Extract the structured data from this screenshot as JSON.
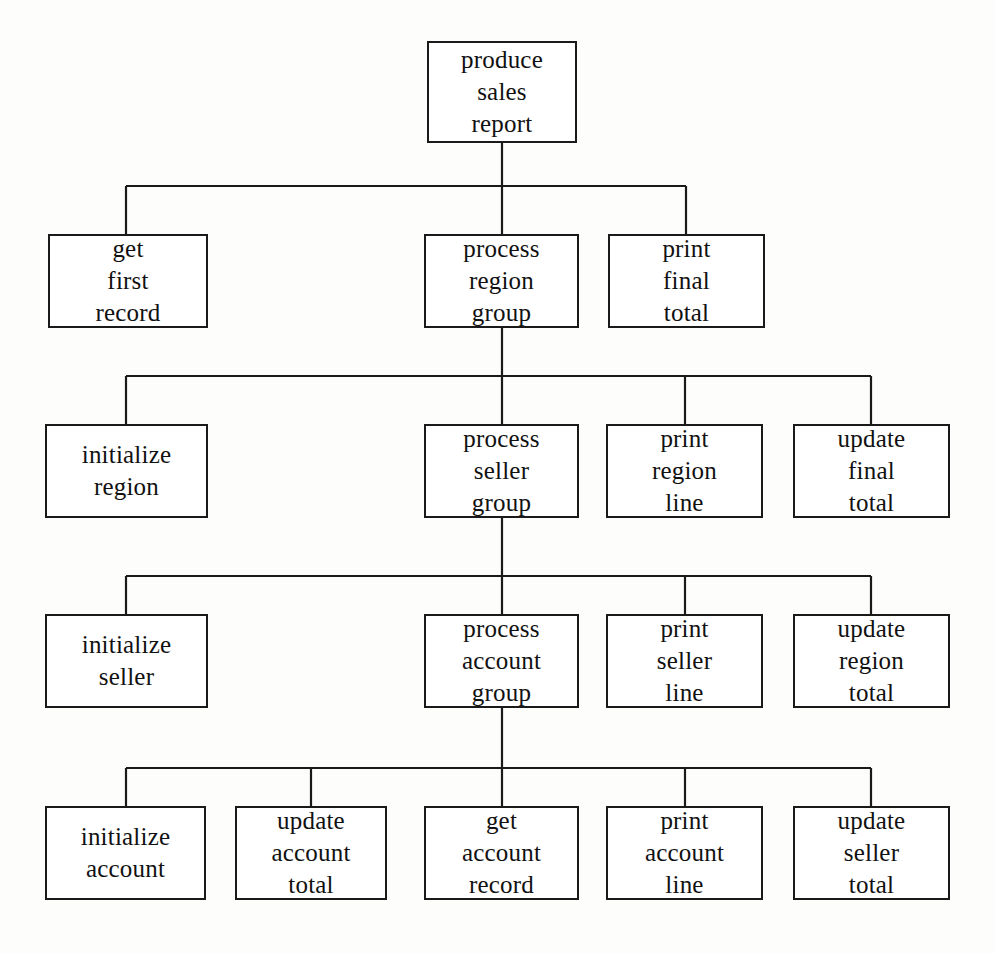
{
  "diagram": {
    "type": "structure-chart",
    "box_border_color": "#1a1a1a",
    "box_fill_color": "#ffffff",
    "line_color": "#1a1a1a",
    "background_color": "#fdfdfc",
    "levels": 5
  },
  "nodes": [
    {
      "id": "produce-sales-report",
      "lines": [
        "produce",
        "sales",
        "report"
      ],
      "level": 1,
      "x": 427,
      "y": 41,
      "w": 150,
      "h": 102
    },
    {
      "id": "get-first-record",
      "lines": [
        "get",
        "first",
        "record"
      ],
      "level": 2,
      "x": 48,
      "y": 234,
      "w": 160,
      "h": 94
    },
    {
      "id": "process-region-group",
      "lines": [
        "process",
        "region",
        "group"
      ],
      "level": 2,
      "x": 424,
      "y": 234,
      "w": 155,
      "h": 94
    },
    {
      "id": "print-final-total",
      "lines": [
        "print",
        "final",
        "total"
      ],
      "level": 2,
      "x": 608,
      "y": 234,
      "w": 157,
      "h": 94
    },
    {
      "id": "initialize-region",
      "lines": [
        "initialize",
        "region"
      ],
      "level": 3,
      "x": 45,
      "y": 424,
      "w": 163,
      "h": 94
    },
    {
      "id": "process-seller-group",
      "lines": [
        "process",
        "seller",
        "group"
      ],
      "level": 3,
      "x": 424,
      "y": 424,
      "w": 155,
      "h": 94
    },
    {
      "id": "print-region-line",
      "lines": [
        "print",
        "region",
        "line"
      ],
      "level": 3,
      "x": 606,
      "y": 424,
      "w": 157,
      "h": 94
    },
    {
      "id": "update-final-total",
      "lines": [
        "update",
        "final",
        "total"
      ],
      "level": 3,
      "x": 793,
      "y": 424,
      "w": 157,
      "h": 94
    },
    {
      "id": "initialize-seller",
      "lines": [
        "initialize",
        "seller"
      ],
      "level": 4,
      "x": 45,
      "y": 614,
      "w": 163,
      "h": 94
    },
    {
      "id": "process-account-group",
      "lines": [
        "process",
        "account",
        "group"
      ],
      "level": 4,
      "x": 424,
      "y": 614,
      "w": 155,
      "h": 94
    },
    {
      "id": "print-seller-line",
      "lines": [
        "print",
        "seller",
        "line"
      ],
      "level": 4,
      "x": 606,
      "y": 614,
      "w": 157,
      "h": 94
    },
    {
      "id": "update-region-total",
      "lines": [
        "update",
        "region",
        "total"
      ],
      "level": 4,
      "x": 793,
      "y": 614,
      "w": 157,
      "h": 94
    },
    {
      "id": "initialize-account",
      "lines": [
        "initialize",
        "account"
      ],
      "level": 5,
      "x": 45,
      "y": 806,
      "w": 161,
      "h": 94
    },
    {
      "id": "update-account-total",
      "lines": [
        "update",
        "account",
        "total"
      ],
      "level": 5,
      "x": 235,
      "y": 806,
      "w": 152,
      "h": 94
    },
    {
      "id": "get-account-record",
      "lines": [
        "get",
        "account",
        "record"
      ],
      "level": 5,
      "x": 424,
      "y": 806,
      "w": 155,
      "h": 94
    },
    {
      "id": "print-account-line",
      "lines": [
        "print",
        "account",
        "line"
      ],
      "level": 5,
      "x": 606,
      "y": 806,
      "w": 157,
      "h": 94
    },
    {
      "id": "update-seller-total",
      "lines": [
        "update",
        "seller",
        "total"
      ],
      "level": 5,
      "x": 793,
      "y": 806,
      "w": 157,
      "h": 94
    }
  ],
  "connectors": [
    {
      "id": "trunk-level1",
      "type": "vertical",
      "x": 502,
      "y1": 143,
      "y2": 186
    },
    {
      "id": "rail-level2",
      "type": "horizontal",
      "y": 186,
      "x1": 126,
      "x2": 686
    },
    {
      "id": "drop-get-first-record",
      "type": "vertical",
      "x": 126,
      "y1": 186,
      "y2": 234
    },
    {
      "id": "drop-process-region-group",
      "type": "vertical",
      "x": 502,
      "y1": 186,
      "y2": 234
    },
    {
      "id": "drop-print-final-total",
      "type": "vertical",
      "x": 686,
      "y1": 186,
      "y2": 234
    },
    {
      "id": "trunk-level2",
      "type": "vertical",
      "x": 502,
      "y1": 328,
      "y2": 376
    },
    {
      "id": "rail-level3",
      "type": "horizontal",
      "y": 376,
      "x1": 126,
      "x2": 871
    },
    {
      "id": "drop-initialize-region",
      "type": "vertical",
      "x": 126,
      "y1": 376,
      "y2": 424
    },
    {
      "id": "drop-process-seller-group",
      "type": "vertical",
      "x": 502,
      "y1": 376,
      "y2": 424
    },
    {
      "id": "drop-print-region-line",
      "type": "vertical",
      "x": 685,
      "y1": 376,
      "y2": 424
    },
    {
      "id": "drop-update-final-total",
      "type": "vertical",
      "x": 871,
      "y1": 376,
      "y2": 424
    },
    {
      "id": "trunk-level3",
      "type": "vertical",
      "x": 502,
      "y1": 518,
      "y2": 576
    },
    {
      "id": "rail-level4",
      "type": "horizontal",
      "y": 576,
      "x1": 126,
      "x2": 871
    },
    {
      "id": "drop-initialize-seller",
      "type": "vertical",
      "x": 126,
      "y1": 576,
      "y2": 614
    },
    {
      "id": "drop-process-account-group",
      "type": "vertical",
      "x": 502,
      "y1": 576,
      "y2": 614
    },
    {
      "id": "drop-print-seller-line",
      "type": "vertical",
      "x": 685,
      "y1": 576,
      "y2": 614
    },
    {
      "id": "drop-update-region-total",
      "type": "vertical",
      "x": 871,
      "y1": 576,
      "y2": 614
    },
    {
      "id": "trunk-level4",
      "type": "vertical",
      "x": 502,
      "y1": 708,
      "y2": 768
    },
    {
      "id": "rail-level5",
      "type": "horizontal",
      "y": 768,
      "x1": 126,
      "x2": 871
    },
    {
      "id": "drop-initialize-account",
      "type": "vertical",
      "x": 126,
      "y1": 768,
      "y2": 806
    },
    {
      "id": "drop-update-account-total",
      "type": "vertical",
      "x": 311,
      "y1": 768,
      "y2": 806
    },
    {
      "id": "drop-get-account-record",
      "type": "vertical",
      "x": 502,
      "y1": 768,
      "y2": 806
    },
    {
      "id": "drop-print-account-line",
      "type": "vertical",
      "x": 685,
      "y1": 768,
      "y2": 806
    },
    {
      "id": "drop-update-seller-total",
      "type": "vertical",
      "x": 871,
      "y1": 768,
      "y2": 806
    }
  ]
}
